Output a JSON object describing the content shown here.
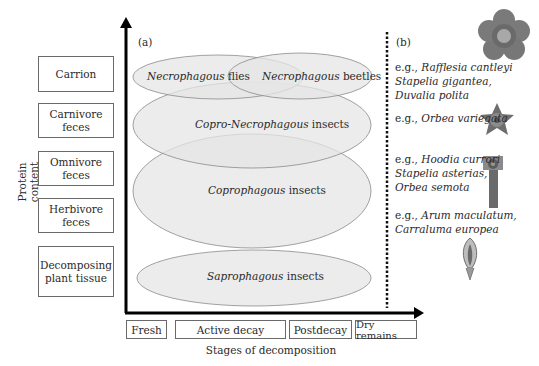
{
  "panel_a": {
    "tag": "(a)",
    "y_axis_label": "Protein content",
    "x_axis_label": "Stages of decomposition",
    "substrates": [
      {
        "label": "Carrion"
      },
      {
        "label": "Carnivore feces"
      },
      {
        "label": "Omnivore feces"
      },
      {
        "label": "Herbivore feces"
      },
      {
        "label": "Decomposing plant tissue"
      }
    ],
    "stages": [
      {
        "label": "Fresh"
      },
      {
        "label": "Active decay"
      },
      {
        "label": "Postdecay"
      },
      {
        "label": "Dry remains"
      }
    ],
    "insect_groups": [
      {
        "italic": "Necrophagous",
        "rest": " flies"
      },
      {
        "italic": "Necrophagous",
        "rest": " beetles"
      },
      {
        "italic": "Copro-Necrophagous",
        "rest": " insects"
      },
      {
        "italic": "Coprophagous",
        "rest": " insects"
      },
      {
        "italic": "Saprophagous",
        "rest": " insects"
      }
    ]
  },
  "panel_b": {
    "tag": "(b)",
    "examples": [
      {
        "prefix": "e.g., ",
        "species": [
          "Rafflesia cantleyi",
          "Stapelia gigantea,",
          "Duvalia polita"
        ],
        "image": "rafflesia-flower"
      },
      {
        "prefix": "e.g., ",
        "species": [
          "Orbea variegata"
        ],
        "image": "orbea-star-flower"
      },
      {
        "prefix": "e.g., ",
        "species": [
          "Hoodia currori",
          "Stapelia asterias,",
          "Orbea semota"
        ],
        "image": "hoodia-plant"
      },
      {
        "prefix": "e.g., ",
        "species": [
          "Arum maculatum,",
          "Carraluma europea"
        ],
        "image": "arum-spathe"
      }
    ]
  },
  "colors": {
    "ellipse_fill": "#e6e6e6",
    "ellipse_stroke": "#8a8a8a",
    "axis": "#000000",
    "box_border": "#6a6a6a"
  }
}
